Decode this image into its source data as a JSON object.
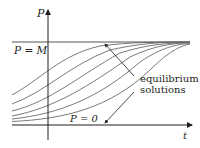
{
  "diagram": {
    "type": "logistic-solution-curves",
    "axes": {
      "vertical_label": "P",
      "horizontal_label": "t"
    },
    "lines": {
      "upper_equilibrium_label": "P = M",
      "lower_equilibrium_label": "P = 0"
    },
    "annotation": {
      "line1": "equilibrium",
      "line2": "solutions"
    },
    "colors": {
      "axis": "#231f20",
      "equilibrium_line": "#555555",
      "curve": "#6e6e6e",
      "text": "#231f20"
    },
    "curves_count": 6
  }
}
